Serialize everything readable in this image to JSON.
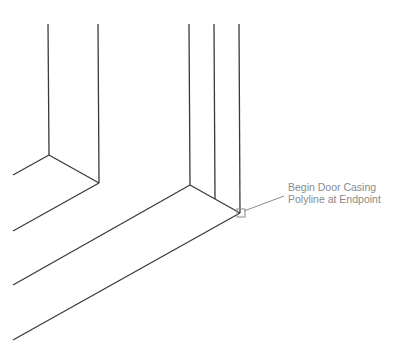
{
  "callout": {
    "line1": "Begin Door Casing",
    "line2": "Polyline at Endpoint"
  },
  "colors": {
    "stroke": "#3a3a3a",
    "callout": "#8a8a8a",
    "marker": "#8a8a8a"
  },
  "drawing": {
    "lines": [
      {
        "id": "left-wall-inner-vertical",
        "x1": 48,
        "y1": 24,
        "x2": 49,
        "y2": 155
      },
      {
        "id": "left-wall-outer-vertical",
        "x1": 98,
        "y1": 24,
        "x2": 99,
        "y2": 183
      },
      {
        "id": "left-wall-top-edge",
        "x1": 49,
        "y1": 155,
        "x2": 99,
        "y2": 183
      },
      {
        "id": "left-floor-back",
        "x1": 49,
        "y1": 155,
        "x2": 13,
        "y2": 175
      },
      {
        "id": "left-floor-front",
        "x1": 99,
        "y1": 183,
        "x2": 13,
        "y2": 231
      },
      {
        "id": "jamb-vertical-1",
        "x1": 189,
        "y1": 24,
        "x2": 190,
        "y2": 185
      },
      {
        "id": "jamb-vertical-2",
        "x1": 214,
        "y1": 24,
        "x2": 215,
        "y2": 199
      },
      {
        "id": "jamb-vertical-3",
        "x1": 239,
        "y1": 24,
        "x2": 240,
        "y2": 213
      },
      {
        "id": "jamb-bottom-edge",
        "x1": 190,
        "y1": 185,
        "x2": 240,
        "y2": 213
      },
      {
        "id": "floor-line-back",
        "x1": 190,
        "y1": 185,
        "x2": 13,
        "y2": 285
      },
      {
        "id": "floor-line-front",
        "x1": 240,
        "y1": 213,
        "x2": 13,
        "y2": 340
      }
    ],
    "leader": {
      "x1": 244,
      "y1": 211,
      "x2": 284,
      "y2": 196
    },
    "marker": {
      "x": 237,
      "y": 209,
      "size": 8
    }
  }
}
